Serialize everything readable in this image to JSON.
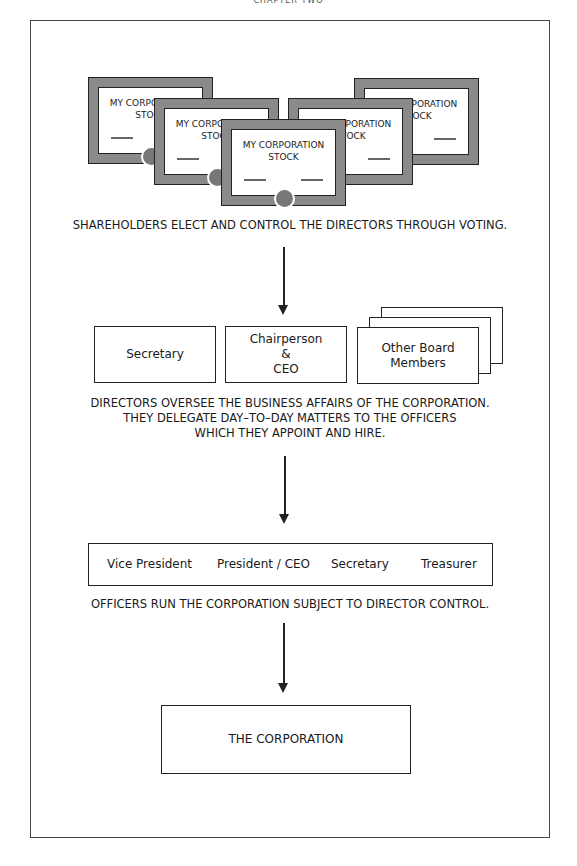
{
  "page": {
    "header": "CHAPTER TWO"
  },
  "shareholders": {
    "certificates": [
      {
        "title_line1": "MY CORPORATION",
        "title_line2": "STOCK"
      },
      {
        "title_line1": "MY CORPORATION",
        "title_line2": "STOCK"
      },
      {
        "title_line1": "MY CORPORATION",
        "title_line2": "STOCK"
      },
      {
        "title_line1": "MY CORPORATION",
        "title_line2": "STOCK"
      },
      {
        "title_line1": "MY CORPORATION",
        "title_line2": "STOCK"
      }
    ],
    "caption": "SHAREHOLDERS ELECT AND CONTROL THE DIRECTORS THROUGH VOTING."
  },
  "directors": {
    "boxes": [
      {
        "label": "Secretary"
      },
      {
        "line1": "Chairperson",
        "line2": "&",
        "line3": "CEO"
      },
      {
        "line1": "Other Board",
        "line2": "Members"
      }
    ],
    "caption_lines": [
      "DIRECTORS OVERSEE THE BUSINESS AFFAIRS OF THE CORPORATION.",
      "THEY DELEGATE DAY–TO–DAY MATTERS TO THE OFFICERS",
      "WHICH THEY APPOINT AND HIRE."
    ]
  },
  "officers": {
    "roles": [
      "Vice President",
      "President / CEO",
      "Secretary",
      "Treasurer"
    ],
    "caption": "OFFICERS RUN THE CORPORATION SUBJECT TO DIRECTOR CONTROL."
  },
  "corporation": {
    "label": "THE CORPORATION"
  },
  "colors": {
    "certificate_border": "#8a8a8a",
    "seal": "#777777",
    "line": "#222222"
  }
}
